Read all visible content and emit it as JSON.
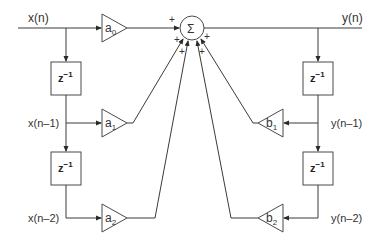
{
  "signals": {
    "input": "x(n)",
    "input_d1": "x(n–1)",
    "input_d2": "x(n–2)",
    "output": "y(n)",
    "output_d1": "y(n–1)",
    "output_d2": "y(n–2)"
  },
  "gains": {
    "a0": {
      "base": "a",
      "sub": "0"
    },
    "a1": {
      "base": "a",
      "sub": "1"
    },
    "a2": {
      "base": "a",
      "sub": "2"
    },
    "b1": {
      "base": "b",
      "sub": "1"
    },
    "b2": {
      "base": "b",
      "sub": "2"
    }
  },
  "delay": {
    "base": "z",
    "sup": "−1"
  },
  "summer": {
    "symbol": "Σ",
    "sign": "+"
  },
  "colors": {
    "stroke": "#3a3a3a",
    "background": "#ffffff"
  }
}
